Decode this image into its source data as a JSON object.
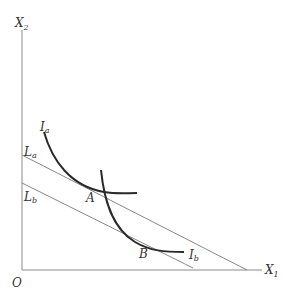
{
  "diagram": {
    "type": "economics-indifference-budget",
    "colors": {
      "axis": "#8a8a8a",
      "budget_line": "#7a7a7a",
      "indifference_curve": "#2a2a2a",
      "label": "#333333"
    },
    "axes": {
      "x_label": "X",
      "x_sub": "1",
      "y_label": "X",
      "y_sub": "2",
      "origin_label": "O"
    },
    "budget_lines": [
      {
        "label": "L",
        "sub": "a"
      },
      {
        "label": "L",
        "sub": "b"
      }
    ],
    "indifference_curves": [
      {
        "label": "I",
        "sub": "a"
      },
      {
        "label": "I",
        "sub": "b"
      }
    ],
    "points": [
      {
        "label": "A"
      },
      {
        "label": "B"
      }
    ]
  }
}
